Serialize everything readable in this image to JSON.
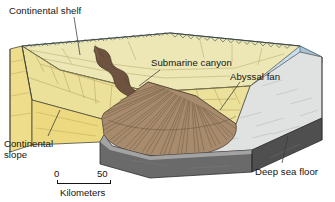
{
  "labels": {
    "continental_shelf": "Continental shelf",
    "submarine_canyon": "Submarine canyon",
    "abyssal_fan": "Abyssal fan",
    "continental_slope_line1": "Continental",
    "continental_slope_line2": "slope",
    "deep_sea_floor": "Deep sea floor"
  },
  "scale": {
    "min": "0",
    "max": "50",
    "units": "Kilometers"
  },
  "colors": {
    "shelf_surface": "#ece7b4",
    "slope_surface": "#ece19a",
    "block_face_left": "#eedd8b",
    "water_surface": "#c3dcee",
    "water_face": "#bed2de",
    "deep_sea_floor": "#dfe2e0",
    "abyssal_fan": "#a88b6d",
    "canyon": "#6e5340",
    "block_face_front": "#6a6a6a",
    "block_face_dark": "#4f4f4f",
    "outline": "#2b2b2b",
    "label_text": "#141414",
    "background": "#ffffff"
  }
}
